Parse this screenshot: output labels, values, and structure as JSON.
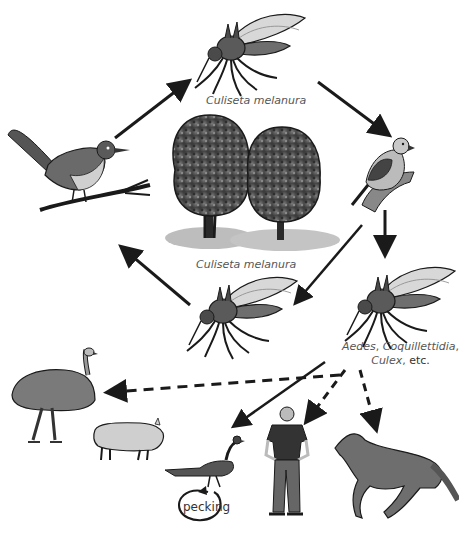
{
  "diagram": {
    "nodes": [
      {
        "id": "mosquito-top",
        "kind": "mosquito",
        "label": "Culiseta melanura"
      },
      {
        "id": "bird-left",
        "kind": "wren",
        "label": ""
      },
      {
        "id": "trees",
        "kind": "trees",
        "label": ""
      },
      {
        "id": "bird-right",
        "kind": "finch",
        "label": ""
      },
      {
        "id": "mosquito-bottom-left",
        "kind": "mosquito",
        "label": "Culiseta melanura"
      },
      {
        "id": "mosquito-bottom-right",
        "kind": "mosquito",
        "label": "Aedes, Coquillettidia, Culex, etc."
      },
      {
        "id": "emu",
        "kind": "emu",
        "label": ""
      },
      {
        "id": "pig",
        "kind": "pig",
        "label": ""
      },
      {
        "id": "pheasant",
        "kind": "pheasant",
        "label": ""
      },
      {
        "id": "human",
        "kind": "human",
        "label": ""
      },
      {
        "id": "horse",
        "kind": "horse",
        "label": ""
      }
    ],
    "labels": {
      "mosquito_top": "Culiseta melanura",
      "mosquito_center": "Culiseta melanura",
      "bridge_genus_1": "Aedes",
      "bridge_genus_2": "Coquillettidia",
      "bridge_genus_3": "Culex",
      "bridge_etc": "etc.",
      "sep": ", ",
      "pecking": "pecking"
    },
    "edges": [
      {
        "from": "bird-left",
        "to": "mosquito-top",
        "style": "solid"
      },
      {
        "from": "mosquito-top",
        "to": "bird-right",
        "style": "solid"
      },
      {
        "from": "bird-right",
        "to": "mosquito-bottom-left",
        "style": "solid"
      },
      {
        "from": "bird-right",
        "to": "mosquito-bottom-right",
        "style": "solid"
      },
      {
        "from": "mosquito-bottom-left",
        "to": "bird-left",
        "style": "solid"
      },
      {
        "from": "mosquito-bottom-right",
        "to": "pheasant",
        "style": "solid"
      },
      {
        "from": "mosquito-bottom-right",
        "to": "emu",
        "style": "dashed"
      },
      {
        "from": "mosquito-bottom-right",
        "to": "human",
        "style": "dashed"
      },
      {
        "from": "mosquito-bottom-right",
        "to": "horse",
        "style": "dashed"
      },
      {
        "from": "pheasant",
        "to": "pheasant",
        "style": "loop",
        "label": "pecking"
      }
    ],
    "colors": {
      "ink": "#1a1a1a",
      "body_gray": "#6e6e6e",
      "light_gray": "#b8b8b8",
      "shadow_gray": "#bdbdbd",
      "text_gray": "#555555"
    }
  }
}
